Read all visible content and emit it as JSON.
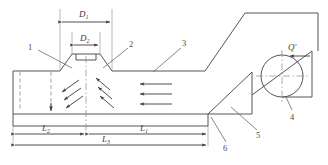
{
  "diagram": {
    "stroke_color": "#555555",
    "dash_color": "#8a8a8a",
    "text_color": "#3a3a3a",
    "background": "#ffffff"
  },
  "dimensions": [
    {
      "id": "D1",
      "label": "D",
      "subscript": "1",
      "orientation": "horizontal",
      "position": "top-nozzle-outer"
    },
    {
      "id": "D2",
      "label": "D",
      "subscript": "2",
      "orientation": "horizontal",
      "position": "top-nozzle-inner"
    },
    {
      "id": "L2",
      "label": "L",
      "subscript": "2",
      "orientation": "horizontal",
      "position": "bottom-left-span"
    },
    {
      "id": "L1",
      "label": "L",
      "subscript": "1",
      "orientation": "horizontal",
      "position": "bottom-right-span"
    },
    {
      "id": "L3",
      "label": "L",
      "subscript": "3",
      "orientation": "horizontal",
      "position": "bottom-total-span"
    }
  ],
  "flow_labels": [
    {
      "id": "Qprime",
      "label": "Q",
      "prime": "′",
      "direction": "left",
      "position": "upper-right-duct"
    }
  ],
  "callouts": [
    {
      "number": "1",
      "x": 32,
      "y": 47,
      "target": "left-hood-wall"
    },
    {
      "number": "2",
      "x": 131,
      "y": 44,
      "target": "nozzle-right-wall"
    },
    {
      "number": "3",
      "x": 184,
      "y": 43,
      "target": "hood-floor"
    },
    {
      "number": "4",
      "x": 295,
      "y": 112,
      "target": "roller"
    },
    {
      "number": "5",
      "x": 260,
      "y": 134,
      "target": "inclined-chute"
    },
    {
      "number": "6",
      "x": 228,
      "y": 146,
      "target": "conveyor-junction"
    }
  ],
  "flow_arrows": {
    "horizontal_count": 3,
    "diagonal_left_count": 3,
    "diagonal_right_count": 3,
    "direction": "left"
  }
}
